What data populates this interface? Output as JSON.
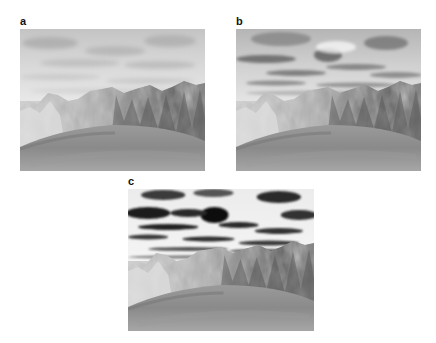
{
  "figure": {
    "panels": [
      {
        "label": "a",
        "description": "terrain render, low-contrast sky",
        "cloud_contrast": "low"
      },
      {
        "label": "b",
        "description": "terrain render, medium-contrast sky",
        "cloud_contrast": "medium"
      },
      {
        "label": "c",
        "description": "terrain render, high-contrast sky",
        "cloud_contrast": "high"
      }
    ]
  },
  "colors": {
    "background": "#ffffff",
    "label": "#111111",
    "ground": "#8e8e8e",
    "mountain_light": "#d8d8d8",
    "mountain_dark": "#4a4a4a"
  }
}
